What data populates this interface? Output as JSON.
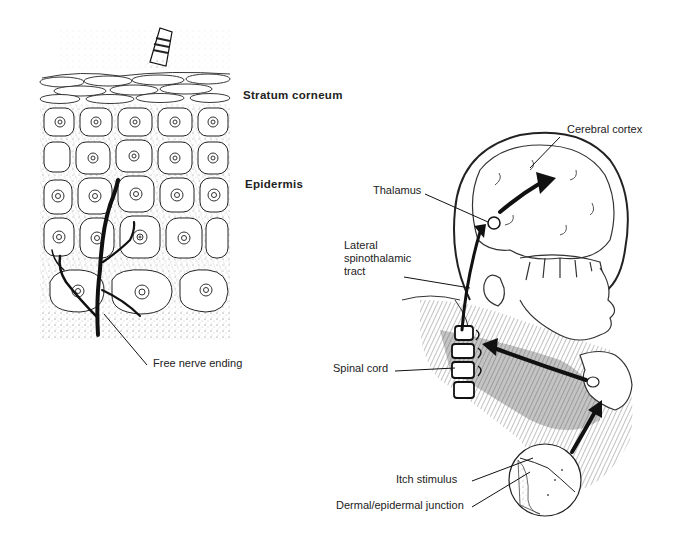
{
  "diagram": {
    "left_panel": {
      "title": "Skin cross-section",
      "labels": {
        "stratum_corneum": "Stratum  corneum",
        "epidermis": "Epidermis",
        "free_nerve_ending": "Free nerve ending"
      }
    },
    "right_panel": {
      "title": "Itch pathway to brain",
      "labels": {
        "cerebral_cortex": "Cerebral cortex",
        "thalamus": "Thalamus",
        "lateral_spinothalamic_tract": "Lateral\nspinothalamic\ntract",
        "spinal_cord": "Spinal cord",
        "itch_stimulus": "Itch stimulus",
        "dermal_epidermal_junction": "Dermal/epidermal junction"
      }
    },
    "colors": {
      "ink": "#1a1a1a",
      "shading": "#7a7a7a",
      "light_shading": "#c8c8c8",
      "background": "#ffffff"
    }
  }
}
